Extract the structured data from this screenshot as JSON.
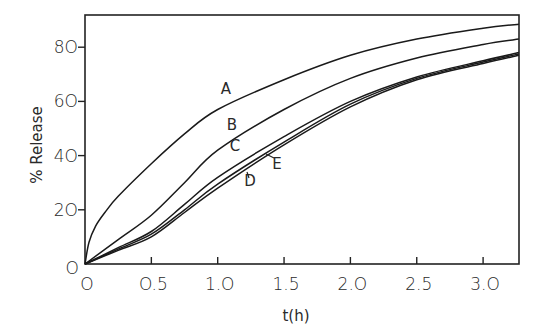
{
  "chart_data": {
    "type": "line",
    "title": "",
    "xlabel": "t(h)",
    "ylabel": "% Release",
    "xlim": [
      0,
      3.27
    ],
    "ylim": [
      0,
      91
    ],
    "grid": false,
    "legend": "inline curve labels",
    "x_ticks": [
      "0",
      "0.5",
      "1.0",
      "1.5",
      "2.0",
      "2.5",
      "3.0"
    ],
    "y_ticks": [
      "0",
      "20",
      "40",
      "60",
      "80"
    ],
    "x": [
      0,
      0.25,
      0.5,
      0.75,
      1.0,
      1.5,
      2.0,
      2.5,
      3.0,
      3.27
    ],
    "series": [
      {
        "name": "A",
        "values": [
          0,
          25,
          37,
          48,
          57,
          68,
          77,
          83,
          87,
          88.5
        ]
      },
      {
        "name": "B",
        "values": [
          0,
          9,
          18,
          30,
          42,
          57,
          68.5,
          76,
          81,
          83
        ]
      },
      {
        "name": "C",
        "values": [
          0,
          6,
          12,
          22,
          32,
          47,
          60,
          69,
          75,
          78
        ]
      },
      {
        "name": "D",
        "values": [
          0,
          5,
          10,
          19,
          28,
          44,
          58,
          68,
          74,
          77
        ]
      },
      {
        "name": "E",
        "values": [
          0,
          5.5,
          11,
          20,
          29.5,
          45,
          59,
          68.5,
          74.5,
          77.5
        ]
      }
    ],
    "annotations": [
      {
        "text": "A",
        "x": 1.0,
        "y": 65
      },
      {
        "text": "B",
        "x": 1.1,
        "y": 46
      },
      {
        "text": "C",
        "x": 1.15,
        "y": 38
      },
      {
        "text": "D",
        "x": 1.25,
        "y": 25
      },
      {
        "text": "E",
        "x": 1.5,
        "y": 32
      }
    ]
  },
  "labels": {
    "x_axis": "t(h)",
    "y_axis": "% Release",
    "x_ticks": [
      "O",
      "O.5",
      "1.O",
      "1.5",
      "2.O",
      "2.5",
      "3.O"
    ],
    "y_ticks": [
      "O",
      "2O",
      "4O",
      "6O",
      "8O"
    ],
    "curves": [
      "A",
      "B",
      "C",
      "D",
      "E"
    ]
  }
}
